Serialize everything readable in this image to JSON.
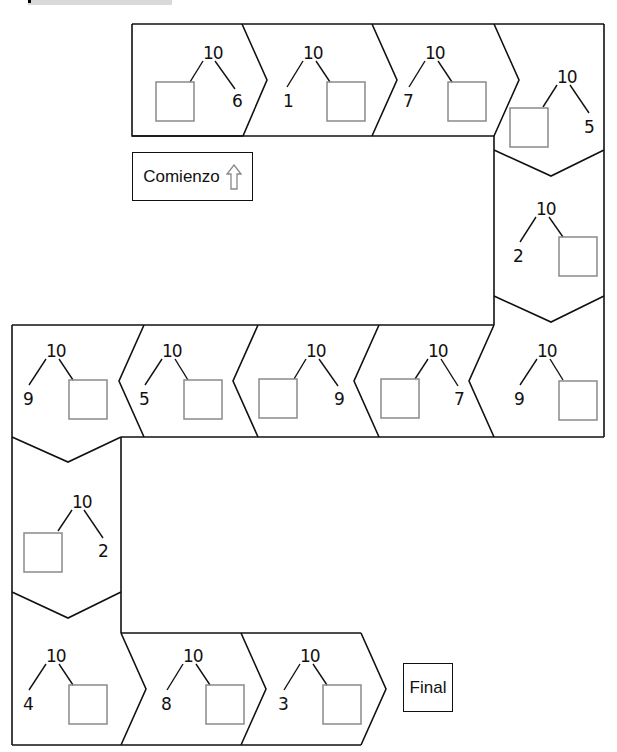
{
  "header": {
    "bar_color": "#d9d9d9"
  },
  "labels": {
    "start": "Comienzo",
    "start_icon": "up-arrow-icon",
    "finish": "Final"
  },
  "colors": {
    "outline": "#111111",
    "answer_box": "#8a8a8a",
    "background": "#ffffff"
  },
  "spaces": [
    {
      "id": 1,
      "whole": "10",
      "part": "6",
      "box_side": "left"
    },
    {
      "id": 2,
      "whole": "10",
      "part": "1",
      "box_side": "right"
    },
    {
      "id": 3,
      "whole": "10",
      "part": "7",
      "box_side": "right"
    },
    {
      "id": 4,
      "whole": "10",
      "part": "5",
      "box_side": "left"
    },
    {
      "id": 5,
      "whole": "10",
      "part": "2",
      "box_side": "right"
    },
    {
      "id": 6,
      "whole": "10",
      "part": "9",
      "box_side": "right"
    },
    {
      "id": 7,
      "whole": "10",
      "part": "7",
      "box_side": "left"
    },
    {
      "id": 8,
      "whole": "10",
      "part": "9",
      "box_side": "left"
    },
    {
      "id": 9,
      "whole": "10",
      "part": "5",
      "box_side": "right"
    },
    {
      "id": 10,
      "whole": "10",
      "part": "3",
      "box_side": "right"
    },
    {
      "id": 11,
      "whole": "10",
      "part": "2",
      "box_side": "left"
    },
    {
      "id": 12,
      "whole": "10",
      "part": "4",
      "box_side": "right"
    },
    {
      "id": 13,
      "whole": "10",
      "part": "8",
      "box_side": "right"
    },
    {
      "id": 14,
      "whole": "10",
      "part": "3",
      "box_side": "right"
    }
  ]
}
